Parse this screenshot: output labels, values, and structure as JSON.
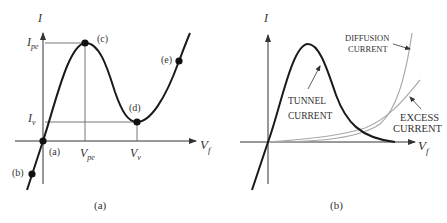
{
  "panel_a": {
    "caption": "(a)",
    "y_axis_label": "I",
    "x_axis_label": "V",
    "x_axis_sub": "f",
    "y_ticks": [
      {
        "main": "I",
        "sub": "pe"
      },
      {
        "main": "I",
        "sub": "v"
      }
    ],
    "x_ticks": [
      {
        "main": "V",
        "sub": "pe"
      },
      {
        "main": "V",
        "sub": "v"
      }
    ],
    "points": [
      {
        "id": "a",
        "label": "(a)"
      },
      {
        "id": "b",
        "label": "(b)"
      },
      {
        "id": "c",
        "label": "(c)"
      },
      {
        "id": "d",
        "label": "(d)"
      },
      {
        "id": "e",
        "label": "(e)"
      }
    ]
  },
  "panel_b": {
    "caption": "(b)",
    "y_axis_label": "I",
    "x_axis_label": "V",
    "x_axis_sub": "f",
    "curves": {
      "tunnel": [
        "TUNNEL",
        "CURRENT"
      ],
      "diffusion": [
        "DIFFUSION",
        "CURRENT"
      ],
      "excess": [
        "EXCESS",
        "CURRENT"
      ]
    }
  },
  "colors": {
    "ink": "#1a1a1a",
    "axis": "#333333",
    "gray_curve": "#a8a8a8",
    "guide": "#555555"
  }
}
